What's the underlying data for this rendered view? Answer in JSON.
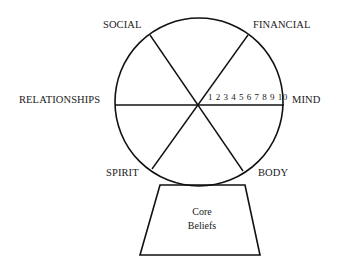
{
  "wheel": {
    "segments": [
      {
        "id": "social",
        "label": "SOCIAL"
      },
      {
        "id": "financial",
        "label": "FINANCIAL"
      },
      {
        "id": "mind",
        "label": "MIND"
      },
      {
        "id": "body",
        "label": "BODY"
      },
      {
        "id": "spirit",
        "label": "SPIRIT"
      },
      {
        "id": "relationships",
        "label": "RELATIONSHIPS"
      }
    ],
    "scale": "1 2 3 4 5 6 7 8 9 10",
    "scale_values": [
      1,
      2,
      3,
      4,
      5,
      6,
      7,
      8,
      9,
      10
    ],
    "line_color": "#111111"
  },
  "base": {
    "line1": "Core",
    "line2": "Beliefs"
  }
}
